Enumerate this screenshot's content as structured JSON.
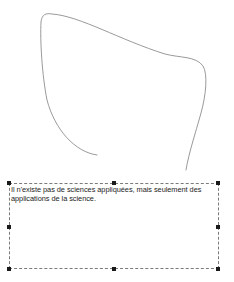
{
  "canvas": {
    "background": "#ffffff"
  },
  "drawing": {
    "shape": "freehand-curve",
    "stroke_color": "#9a9a9a",
    "path": "M 97 155 C 75 152, 55 130, 47 100 C 42 75, 40 40, 41 22 C 42 14, 46 13, 52 14 C 80 16, 120 40, 165 54 C 180 58, 196 56, 203 66 C 208 74, 206 95, 201 113 C 195 135, 189 152, 186 170"
  },
  "textbox": {
    "text": "Il n'existe pas de sciences appliquées, mais seulement des applications de la science.",
    "border_style": "dashed",
    "selected": true,
    "handles": [
      "top-left",
      "top-center",
      "top-right",
      "middle-left",
      "middle-right",
      "bottom-left",
      "bottom-center",
      "bottom-right"
    ]
  }
}
